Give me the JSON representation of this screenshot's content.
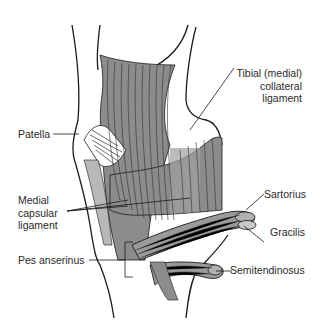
{
  "diagram": {
    "colors": {
      "outline": "#1a1a1a",
      "ligament_fill": "#8c8c8c",
      "light_fill": "#b8b8b8",
      "fiber": "#3a3a3a",
      "text": "#2a2a2a",
      "background": "#ffffff"
    },
    "labels": {
      "tibial_collateral_line1": "Tibial (medial)",
      "tibial_collateral_line2": "collateral",
      "tibial_collateral_line3": "ligament",
      "patella": "Patella",
      "medial_capsular_line1": "Medial",
      "medial_capsular_line2": "capsular",
      "medial_capsular_line3": "ligament",
      "pes_anserinus": "Pes anserinus",
      "sartorius": "Sartorius",
      "gracilis": "Gracilis",
      "semitendinosus": "Semitendinosus"
    }
  }
}
